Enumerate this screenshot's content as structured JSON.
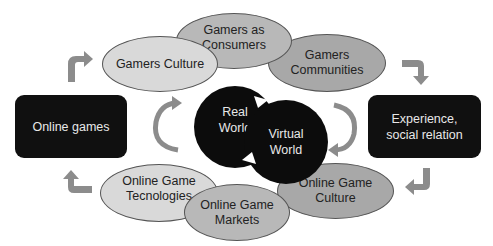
{
  "diagram": {
    "boxes": {
      "left": "Online games",
      "right": "Experience, social relation"
    },
    "top_ellipses": [
      {
        "label": "Gamers Culture"
      },
      {
        "label": "Gamers as Consumers"
      },
      {
        "label": "Gamers Communities"
      }
    ],
    "bottom_ellipses": [
      {
        "label": "Online Game Tecnologies"
      },
      {
        "label": "Online Game Markets"
      },
      {
        "label": "Online Game Culture"
      }
    ],
    "center": {
      "left": "Real World",
      "right": "Virtual World"
    },
    "colors": {
      "box": "#101010",
      "ellipse_light": "#d9d9d9",
      "ellipse_mid": "#b8b8b8",
      "ellipse_dark": "#a8a8a8",
      "arrow": "#8c8c8c"
    }
  }
}
